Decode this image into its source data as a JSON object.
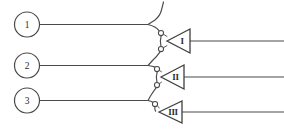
{
  "diagram": {
    "type": "electrical-schematic-line-drawing",
    "background_color": "#ffffff",
    "line_color": "#4a4a4a",
    "width": 284,
    "height": 135,
    "terminals": [
      {
        "label": "1",
        "cx": 27,
        "cy": 24.5,
        "r": 12.5,
        "wire_y": 24.5,
        "wire_x_start": 39.5,
        "wire_x_end": 148
      },
      {
        "label": "2",
        "cx": 27,
        "cy": 65.5,
        "r": 12.5,
        "wire_y": 65.5,
        "wire_x_start": 39.5,
        "wire_x_end": 148
      },
      {
        "label": "3",
        "cx": 27,
        "cy": 100.5,
        "r": 12.5,
        "wire_y": 100.5,
        "wire_x_start": 39.5,
        "wire_x_end": 148
      }
    ],
    "amplifiers": [
      {
        "label": "I",
        "apex_x": 167,
        "tip_y": 41,
        "base_x": 190,
        "top_y": 29,
        "bottom_y": 53,
        "out_x_end": 284
      },
      {
        "label": "II",
        "apex_x": 161,
        "tip_y": 77,
        "base_x": 184,
        "top_y": 65,
        "bottom_y": 89,
        "out_x_end": 284
      },
      {
        "label": "III",
        "apex_x": 159,
        "tip_y": 112,
        "base_x": 182,
        "top_y": 101,
        "bottom_y": 123,
        "out_x_end": 284
      }
    ],
    "nodes": [
      {
        "cx": 161,
        "cy": 33,
        "r": 2.6
      },
      {
        "cx": 161,
        "cy": 49,
        "r": 2.6
      },
      {
        "cx": 157,
        "cy": 69,
        "r": 2.6
      },
      {
        "cx": 157,
        "cy": 85,
        "r": 2.6
      },
      {
        "cx": 155,
        "cy": 104,
        "r": 2.6
      }
    ],
    "branch_wires": [
      {
        "name": "top-branch-up",
        "path": "M 148 24.5 L 155 20 Q 160 16 161 10 L 163 2"
      },
      {
        "name": "t1-down-to-node",
        "path": "M 148 24.5 Q 156 26 159 30.5"
      },
      {
        "name": "node1-to-node2",
        "path": "M 161 35.6 Q 160 41 161 46.4"
      },
      {
        "name": "node2-down",
        "path": "M 160.5 51.4 Q 157 56 152 60 L 148 65.5"
      },
      {
        "name": "t2-down-to-node",
        "path": "M 148 65.5 Q 153 66 155.4 67"
      },
      {
        "name": "node3-to-node4",
        "path": "M 157 71.6 Q 156 77 157 82.4"
      },
      {
        "name": "node4-down",
        "path": "M 156.5 87.4 Q 153 92 150 96 L 148 100.5"
      },
      {
        "name": "t3-down-to-node",
        "path": "M 148 100.5 Q 151 101 153.5 102.3"
      },
      {
        "name": "node5-to-amp3",
        "path": "M 155 106.6 Q 154.5 109 155.5 111"
      }
    ],
    "amp_inputs": [
      {
        "name": "amp1-input",
        "path": "M 161 33 L 167 36"
      },
      {
        "name": "amp1-input-b",
        "path": "M 161 49 L 167 46"
      },
      {
        "name": "amp2-input",
        "path": "M 157 69 L 161 72"
      },
      {
        "name": "amp2-input-b",
        "path": "M 157 85 L 161 82"
      },
      {
        "name": "amp3-input",
        "path": "M 155.5 111 L 159 111.5"
      }
    ]
  }
}
